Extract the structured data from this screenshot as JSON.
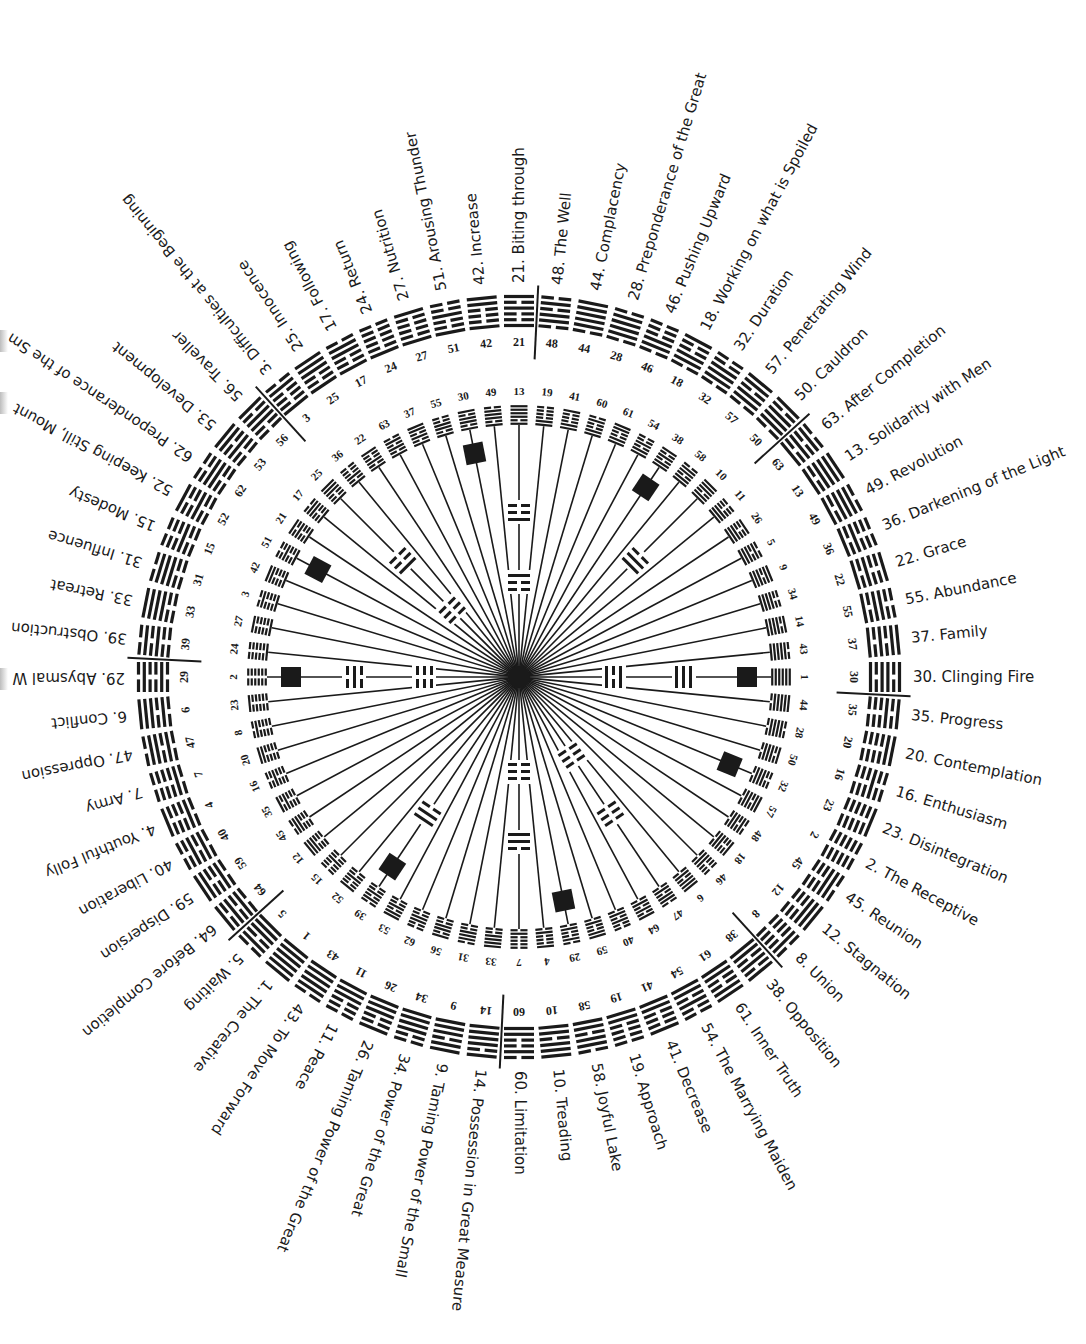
{
  "diagram": {
    "type": "circular-hexagram-chart",
    "center": {
      "x": 519,
      "y": 677
    },
    "colors": {
      "ink": "#1a1a1a",
      "background": "#ffffff"
    },
    "outer_ring": {
      "description": "King Wen names, arranged clockwise; 30 at east, 29 at west",
      "start_angle_deg": 0,
      "sequence_clockwise_from_east": [
        {
          "n": 30,
          "name": "Clinging Fire"
        },
        {
          "n": 35,
          "name": "Progress"
        },
        {
          "n": 20,
          "name": "Contemplation"
        },
        {
          "n": 16,
          "name": "Enthusiasm"
        },
        {
          "n": 23,
          "name": "Disintegration"
        },
        {
          "n": 2,
          "name": "The Receptive"
        },
        {
          "n": 45,
          "name": "Reunion"
        },
        {
          "n": 12,
          "name": "Stagnation"
        },
        {
          "n": 8,
          "name": "Union"
        },
        {
          "n": 38,
          "name": "Opposition"
        },
        {
          "n": 61,
          "name": "Inner Truth"
        },
        {
          "n": 54,
          "name": "The Marrying Maiden"
        },
        {
          "n": 41,
          "name": "Decrease"
        },
        {
          "n": 19,
          "name": "Approach"
        },
        {
          "n": 58,
          "name": "Joyful Lake"
        },
        {
          "n": 10,
          "name": "Treading"
        },
        {
          "n": 60,
          "name": "Limitation"
        },
        {
          "n": 14,
          "name": "Possession in Great Measure"
        },
        {
          "n": 9,
          "name": "Taming Power of the Small"
        },
        {
          "n": 34,
          "name": "Power of the Great"
        },
        {
          "n": 26,
          "name": "Taming Power of the Great"
        },
        {
          "n": 11,
          "name": "Peace"
        },
        {
          "n": 43,
          "name": "To Move Forward"
        },
        {
          "n": 1,
          "name": "The Creative"
        },
        {
          "n": 5,
          "name": "Waiting"
        },
        {
          "n": 64,
          "name": "Before Completion"
        },
        {
          "n": 59,
          "name": "Dispersion"
        },
        {
          "n": 40,
          "name": "Liberation"
        },
        {
          "n": 4,
          "name": "Youthful Folly"
        },
        {
          "n": 7,
          "name": "Army"
        },
        {
          "n": 47,
          "name": "Oppression"
        },
        {
          "n": 6,
          "name": "Conflict"
        },
        {
          "n": 29,
          "name": "Abysmal W"
        },
        {
          "n": 39,
          "name": "Obstruction"
        },
        {
          "n": 33,
          "name": "Retreat"
        },
        {
          "n": 31,
          "name": "Influence"
        },
        {
          "n": 15,
          "name": "Modesty"
        },
        {
          "n": 52,
          "name": "Keeping Still, Mount"
        },
        {
          "n": 62,
          "name": "Preponderance of the Sm"
        },
        {
          "n": 53,
          "name": "Development"
        },
        {
          "n": 56,
          "name": "Traveller"
        },
        {
          "n": 3,
          "name": "Difficulties at the Beginning"
        },
        {
          "n": 25,
          "name": "Innocence"
        },
        {
          "n": 17,
          "name": "Following"
        },
        {
          "n": 24,
          "name": "Return"
        },
        {
          "n": 27,
          "name": "Nutrition"
        },
        {
          "n": 51,
          "name": "Arousing Thunder"
        },
        {
          "n": 42,
          "name": "Increase"
        },
        {
          "n": 21,
          "name": "Biting through"
        },
        {
          "n": 48,
          "name": "The Well"
        },
        {
          "n": 44,
          "name": "Complacency"
        },
        {
          "n": 28,
          "name": "Preponderance of the Great"
        },
        {
          "n": 46,
          "name": "Pushing Upward"
        },
        {
          "n": 18,
          "name": "Working on what is Spoiled"
        },
        {
          "n": 32,
          "name": "Duration"
        },
        {
          "n": 57,
          "name": "Penetrating Wind"
        },
        {
          "n": 50,
          "name": "Cauldron"
        },
        {
          "n": 63,
          "name": "After Completion"
        },
        {
          "n": 13,
          "name": "Solidarity with Men"
        },
        {
          "n": 49,
          "name": "Revolution"
        },
        {
          "n": 36,
          "name": "Darkening of the Light"
        },
        {
          "n": 22,
          "name": "Grace"
        },
        {
          "n": 55,
          "name": "Abundance"
        },
        {
          "n": 37,
          "name": "Family"
        }
      ],
      "divider_after_indices": [
        0,
        8,
        16,
        24,
        32,
        40,
        48,
        56
      ]
    },
    "inner_ring": {
      "description": "Inner numbered hexagrams on spokes; 1 at east, 2 at west",
      "sequence_clockwise_from_east": [
        1,
        44,
        28,
        50,
        32,
        57,
        48,
        18,
        46,
        6,
        47,
        64,
        40,
        59,
        29,
        4,
        7,
        33,
        31,
        56,
        62,
        53,
        39,
        52,
        15,
        12,
        45,
        35,
        16,
        20,
        8,
        23,
        2,
        24,
        27,
        3,
        42,
        51,
        21,
        17,
        25,
        36,
        22,
        63,
        37,
        55,
        30,
        49,
        13,
        19,
        41,
        60,
        61,
        54,
        38,
        58,
        10,
        11,
        26,
        5,
        9,
        34,
        14,
        43
      ],
      "square_markers_on": [
        1,
        2,
        30,
        29,
        38,
        32,
        51,
        39
      ],
      "trigram_markers": [
        {
          "at": 1,
          "marks": [
            "heaven",
            "fire"
          ]
        },
        {
          "at": 2,
          "marks": [
            "water",
            "earth"
          ]
        },
        {
          "at": 13,
          "marks": [
            "thunder-inv",
            "mountain"
          ]
        },
        {
          "at": 7,
          "marks": [
            "lake-inv",
            "earth-inv"
          ]
        },
        {
          "at": 10,
          "marks": [
            "lake"
          ]
        },
        {
          "at": 47,
          "marks": [
            "earth",
            "earth"
          ]
        },
        {
          "at": 25,
          "marks": [
            "thunder",
            "earth"
          ]
        },
        {
          "at": 39,
          "marks": [
            "wind"
          ]
        }
      ]
    }
  }
}
